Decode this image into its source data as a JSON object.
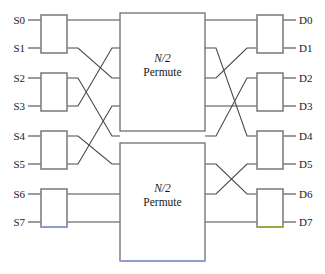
{
  "diagram": {
    "canvas": {
      "width": 325,
      "height": 274,
      "background": "#ffffff"
    },
    "colors": {
      "wire": "#4a4a4a",
      "switch_box_stroke": "#808080",
      "permute_box_stroke": "#6e6e6e",
      "text": "#1a1a1a",
      "tint_blue": "#8f9ed2",
      "tint_green": "#9aab3c"
    },
    "source_labels": [
      "S0",
      "S1",
      "S2",
      "S3",
      "S4",
      "S5",
      "S6",
      "S7"
    ],
    "destination_labels": [
      "D0",
      "D1",
      "D2",
      "D3",
      "D4",
      "D5",
      "D6",
      "D7"
    ],
    "port_rows_y": [
      20,
      48,
      78,
      106,
      136,
      164,
      194,
      222
    ],
    "input_switches": [
      {
        "name": "input-switch-0",
        "ports": [
          "S0",
          "S1"
        ],
        "x": 41,
        "y": 15,
        "w": 26,
        "h": 38
      },
      {
        "name": "input-switch-1",
        "ports": [
          "S2",
          "S3"
        ],
        "x": 41,
        "y": 73,
        "w": 26,
        "h": 38
      },
      {
        "name": "input-switch-2",
        "ports": [
          "S4",
          "S5"
        ],
        "x": 41,
        "y": 131,
        "w": 26,
        "h": 38
      },
      {
        "name": "input-switch-3",
        "ports": [
          "S6",
          "S7"
        ],
        "x": 41,
        "y": 189,
        "w": 26,
        "h": 38
      }
    ],
    "output_switches": [
      {
        "name": "output-switch-0",
        "ports": [
          "D0",
          "D1"
        ],
        "x": 257,
        "y": 15,
        "w": 26,
        "h": 38
      },
      {
        "name": "output-switch-1",
        "ports": [
          "D2",
          "D3"
        ],
        "x": 257,
        "y": 73,
        "w": 26,
        "h": 38
      },
      {
        "name": "output-switch-2",
        "ports": [
          "D4",
          "D5"
        ],
        "x": 257,
        "y": 131,
        "w": 26,
        "h": 38
      },
      {
        "name": "output-switch-3",
        "ports": [
          "D6",
          "D7"
        ],
        "x": 257,
        "y": 189,
        "w": 26,
        "h": 38
      }
    ],
    "permute_blocks": [
      {
        "name": "permute-block-top",
        "line1": "N/2",
        "line2": "Permute",
        "x": 120,
        "y": 13,
        "w": 85,
        "h": 118,
        "input_rows_y": [
          20,
          48,
          78,
          106
        ],
        "output_rows_y": [
          20,
          48,
          78,
          106
        ]
      },
      {
        "name": "permute-block-bottom",
        "line1": "N/2",
        "line2": "Permute",
        "x": 120,
        "y": 143,
        "w": 85,
        "h": 118,
        "input_rows_y": [
          136,
          164,
          194,
          222
        ],
        "output_rows_y": [
          136,
          164,
          194,
          222
        ]
      }
    ],
    "left_stage_routing": [
      {
        "from_row": 0,
        "to_row": 0,
        "note": "S0 switch upper out to top permuter in 0"
      },
      {
        "from_row": 1,
        "to_row": 2,
        "note": "S1 switch lower out to top permuter in 2"
      },
      {
        "from_row": 2,
        "to_row": 4,
        "note": "S2 switch upper out to bottom permuter in 0"
      },
      {
        "from_row": 3,
        "to_row": 1,
        "note": "S3 switch lower out to top permuter in 1"
      },
      {
        "from_row": 4,
        "to_row": 5,
        "note": "S4 switch upper out to bottom permuter in 1"
      },
      {
        "from_row": 5,
        "to_row": 3,
        "note": "S5 switch lower out to top permuter in 3"
      },
      {
        "from_row": 6,
        "to_row": 6,
        "note": "S6 switch upper out to bottom permuter in 2"
      },
      {
        "from_row": 7,
        "to_row": 7,
        "note": "S7 switch lower out to bottom permuter in 3"
      }
    ],
    "right_stage_routing": [
      {
        "from_row": 0,
        "to_row": 0,
        "note": "top permuter out 0 to D0 switch upper in"
      },
      {
        "from_row": 1,
        "to_row": 4,
        "note": "top permuter out 1 to D4 switch upper in"
      },
      {
        "from_row": 2,
        "to_row": 1,
        "note": "top permuter out 2 to D1 switch lower in"
      },
      {
        "from_row": 3,
        "to_row": 3,
        "note": "top permuter out 3 to D3 switch lower in"
      },
      {
        "from_row": 4,
        "to_row": 2,
        "note": "bottom permuter out 0 to D2 switch upper in"
      },
      {
        "from_row": 5,
        "to_row": 6,
        "note": "bottom permuter out 1 to D6 switch upper in"
      },
      {
        "from_row": 6,
        "to_row": 5,
        "note": "bottom permuter out 2 to D5 switch lower in"
      },
      {
        "from_row": 7,
        "to_row": 7,
        "note": "bottom permuter out 3 to D7 switch lower in"
      }
    ],
    "accent_edges": [
      {
        "name": "input-switch-3-bottom-tint",
        "color": "#8f9ed2",
        "x1": 41,
        "y1": 227,
        "x2": 67,
        "y2": 227
      },
      {
        "name": "permute-block-bottom-tint",
        "color": "#8f9ed2",
        "x1": 120,
        "y1": 261,
        "x2": 205,
        "y2": 261
      },
      {
        "name": "output-switch-3-bottom-tint",
        "color": "#9aab3c",
        "x1": 257,
        "y1": 227,
        "x2": 283,
        "y2": 227
      }
    ]
  }
}
